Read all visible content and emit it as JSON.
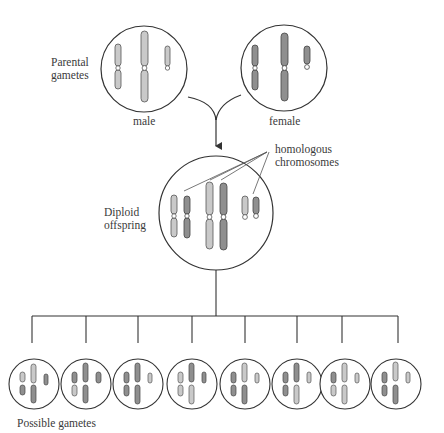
{
  "diagram": {
    "labels": {
      "parental_line1": "Parental",
      "parental_line2": "gametes",
      "male": "male",
      "female": "female",
      "homologous_line1": "homologous",
      "homologous_line2": "chromosomes",
      "diploid_line1": "Diploid",
      "diploid_line2": "offspring",
      "possible_gametes": "Possible gametes"
    },
    "colors": {
      "male_chromosome": "#c9c9c9",
      "female_chromosome": "#8f8f8f",
      "outline": "#333333",
      "background": "#ffffff"
    },
    "nodes": {
      "male_gamete": {
        "chromosome_pairs_shown": 3
      },
      "female_gamete": {
        "chromosome_pairs_shown": 3
      },
      "diploid_offspring": {
        "chromosome_count": 6
      },
      "possible_gametes": {
        "count": 8
      }
    }
  }
}
